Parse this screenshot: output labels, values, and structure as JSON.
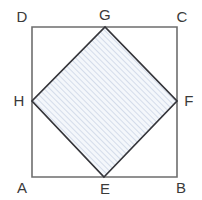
{
  "figure": {
    "background_color": "#ffffff",
    "outer_square": {
      "name": "ABCD",
      "stroke_color": "#6e6e6e",
      "stroke_width": 1.6,
      "fill": "none",
      "corners": [
        {
          "label": "A",
          "x": 32,
          "y": 177,
          "label_x": 22,
          "label_y": 193
        },
        {
          "label": "B",
          "x": 177,
          "y": 177,
          "label_x": 178,
          "label_y": 193
        },
        {
          "label": "C",
          "x": 177,
          "y": 27,
          "label_x": 178,
          "label_y": 22
        },
        {
          "label": "D",
          "x": 32,
          "y": 27,
          "label_x": 22,
          "label_y": 22
        }
      ],
      "path": "M 32 27 L 177 27 L 177 177 L 32 177 Z"
    },
    "inner_square": {
      "name": "EFGH",
      "stroke_color": "#35353a",
      "stroke_width": 1.7,
      "fill_color": "#f4f7fb",
      "hatch_color": "#b9c6dd",
      "hatch_spacing": 4,
      "hatch_direction": "forward-slash",
      "vertices": [
        {
          "label": "E",
          "x": 104,
          "y": 177,
          "label_x": 105,
          "label_y": 194
        },
        {
          "label": "F",
          "x": 177,
          "y": 101,
          "label_x": 189,
          "label_y": 106
        },
        {
          "label": "G",
          "x": 105,
          "y": 27,
          "label_x": 105,
          "label_y": 20
        },
        {
          "label": "H",
          "x": 32,
          "y": 101,
          "label_x": 19,
          "label_y": 106
        }
      ],
      "path": "M 104 177 L 177 101 L 105 27 L 32 101 Z"
    },
    "labels": [
      "A",
      "B",
      "C",
      "D",
      "E",
      "F",
      "G",
      "H"
    ],
    "label_color": "#3a3a3a",
    "label_font_size": 15
  }
}
